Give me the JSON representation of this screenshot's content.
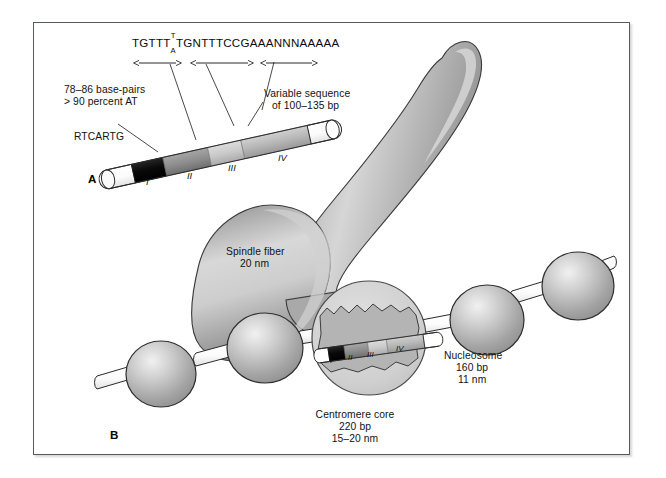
{
  "figure": {
    "panels": [
      {
        "id": "A",
        "label": "A"
      },
      {
        "id": "B",
        "label": "B"
      }
    ],
    "sequence": {
      "text_left": "TGTTT",
      "stacked_top": "T",
      "stacked_bottom": "A",
      "text_right": "TGNTTTCCGAAANNNAAAAA"
    },
    "annotations": {
      "rtcartg": "RTCARTG",
      "base_pairs": "78–86 base-pairs",
      "at_percent": "> 90 percent AT",
      "variable_1": "Variable sequence",
      "variable_2": "of 100–135 bp",
      "spindle_1": "Spindle fiber",
      "spindle_2": "20 nm",
      "nucleosome_1": "Nucleosome",
      "nucleosome_2": "160 bp",
      "nucleosome_3": "11 nm",
      "centromere_1": "Centromere core",
      "centromere_2": "220 bp",
      "centromere_3": "15–20 nm"
    },
    "regions": [
      {
        "numeral": "I",
        "fill": "#0d0d0d"
      },
      {
        "numeral": "II",
        "fill": "#8e8e8e"
      },
      {
        "numeral": "III",
        "fill": "#c9c9c9"
      },
      {
        "numeral": "IV",
        "fill": "#b4b4b4"
      }
    ],
    "colors": {
      "frame_border": "#555a5e",
      "page_background": "#ffffff",
      "spindle_fiber": "#9b9b9b",
      "spindle_highlight": "#d3d3d3",
      "nucleosome": "#a8a8a8",
      "nucleosome_highlight": "#e8e8e8",
      "inset_circle": "#cfcfcf",
      "centromere_blob": "#b9b9b9",
      "linker_dna": "#ffffff",
      "outline": "#2b2b2b",
      "text": "#121212"
    }
  }
}
